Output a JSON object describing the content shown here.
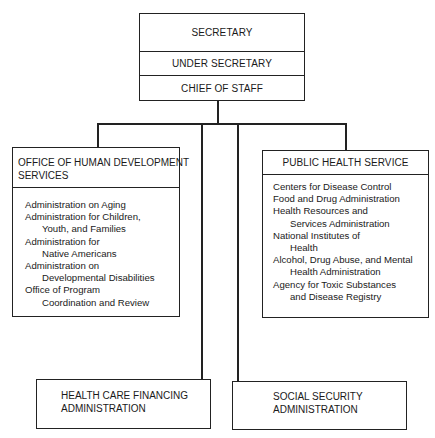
{
  "top": {
    "secretary": "SECRETARY",
    "under_secretary": "UNDER SECRETARY",
    "chief_of_staff": "CHIEF OF STAFF"
  },
  "ohds": {
    "title_line1": "OFFICE OF HUMAN DEVELOPMENT",
    "title_line2": "SERVICES",
    "items": [
      {
        "line1": "Administration on Aging",
        "line2": ""
      },
      {
        "line1": "Administration for Children,",
        "line2": "Youth, and Families"
      },
      {
        "line1": "Administration for",
        "line2": "Native Americans"
      },
      {
        "line1": "Administration on",
        "line2": "Developmental Disabilities"
      },
      {
        "line1": "Office of Program",
        "line2": "Coordination and Review"
      }
    ]
  },
  "phs": {
    "title": "PUBLIC HEALTH SERVICE",
    "items": [
      {
        "line1": "Centers for Disease Control",
        "line2": ""
      },
      {
        "line1": "Food and Drug Administration",
        "line2": ""
      },
      {
        "line1": "Health Resources and",
        "line2": "Services Administration"
      },
      {
        "line1": "National Institutes of",
        "line2": "Health"
      },
      {
        "line1": "Alcohol, Drug Abuse, and Mental",
        "line2": "Health Administration"
      },
      {
        "line1": "Agency for Toxic Substances",
        "line2": "and Disease Registry"
      }
    ]
  },
  "hcfa": {
    "line1": "HEALTH CARE FINANCING",
    "line2": "ADMINISTRATION"
  },
  "ssa": {
    "line1": "SOCIAL SECURITY",
    "line2": "ADMINISTRATION"
  }
}
